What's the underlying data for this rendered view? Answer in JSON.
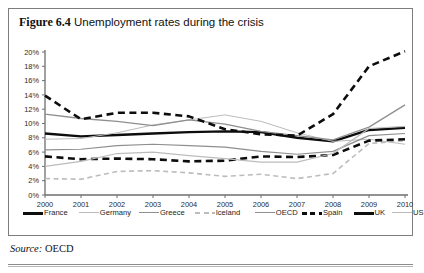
{
  "figure": {
    "label": "Figure 6.4",
    "title": "Unemployment rates during the crisis",
    "source_word": "Source:",
    "source_value": "OECD"
  },
  "colors": {
    "black": "#0d0d0d",
    "dark_gray": "#4a4a4a",
    "mid_gray": "#8f8f8f",
    "light_gray": "#bcbcbc",
    "axis": "#6e6e6e",
    "border": "#7d7d7d",
    "text": "#1d1d1d"
  },
  "chart_data": {
    "type": "line",
    "title": "Unemployment rates during the crisis",
    "xlabel": "",
    "ylabel": "",
    "xlim": [
      2000,
      2010
    ],
    "ylim": [
      0,
      20
    ],
    "ytick_step": 2,
    "grid": false,
    "legend_position": "bottom",
    "x": [
      2000,
      2001,
      2002,
      2003,
      2004,
      2005,
      2006,
      2007,
      2008,
      2009,
      2010
    ],
    "xtick_labels": [
      "2000",
      "2001",
      "2002",
      "2003",
      "2004",
      "2005",
      "2006",
      "2007",
      "2008",
      "2009",
      "2010"
    ],
    "ytick_labels": [
      "0%",
      "2%",
      "4%",
      "6%",
      "8%",
      "10%",
      "12%",
      "14%",
      "16%",
      "18%",
      "20%"
    ],
    "series": [
      {
        "name": "France",
        "style": "solid",
        "width": 2.4,
        "color": "#0d0d0d",
        "values": [
          8.6,
          8.2,
          8.4,
          8.6,
          8.8,
          8.9,
          8.8,
          8.0,
          7.5,
          9.1,
          9.4
        ]
      },
      {
        "name": "Germany",
        "style": "solid",
        "width": 1.0,
        "color": "#bcbcbc",
        "values": [
          7.8,
          7.9,
          8.7,
          9.8,
          10.5,
          11.2,
          10.3,
          8.7,
          7.5,
          7.8,
          7.1
        ]
      },
      {
        "name": "Greece",
        "style": "solid",
        "width": 1.3,
        "color": "#8f8f8f",
        "values": [
          11.3,
          10.7,
          10.3,
          9.7,
          10.5,
          9.9,
          8.9,
          8.3,
          7.7,
          9.5,
          12.6
        ]
      },
      {
        "name": "Iceland",
        "style": "dashed",
        "width": 1.6,
        "color": "#bcbcbc",
        "values": [
          2.3,
          2.2,
          3.3,
          3.4,
          3.1,
          2.6,
          2.9,
          2.3,
          3.0,
          7.2,
          7.6
        ]
      },
      {
        "name": "OECD",
        "style": "solid",
        "width": 1.2,
        "color": "#8f8f8f",
        "values": [
          6.3,
          6.4,
          6.9,
          7.1,
          6.9,
          6.7,
          6.1,
          5.7,
          6.1,
          8.3,
          8.6
        ]
      },
      {
        "name": "Spain",
        "style": "dashed",
        "width": 2.6,
        "color": "#0d0d0d",
        "values": [
          13.9,
          10.6,
          11.5,
          11.5,
          11.0,
          9.2,
          8.5,
          8.3,
          11.3,
          18.0,
          20.1
        ]
      },
      {
        "name": "UK",
        "style": "dashed",
        "width": 2.6,
        "color": "#0d0d0d",
        "values": [
          5.4,
          5.0,
          5.1,
          5.0,
          4.7,
          4.8,
          5.4,
          5.3,
          5.6,
          7.6,
          7.8
        ]
      },
      {
        "name": "US",
        "style": "solid",
        "width": 1.2,
        "color": "#bcbcbc",
        "values": [
          4.0,
          4.7,
          5.8,
          6.0,
          5.5,
          5.1,
          4.6,
          4.6,
          5.8,
          9.3,
          9.6
        ]
      }
    ]
  },
  "legend": {
    "items": [
      {
        "label": "France",
        "style": "solid",
        "width": 2.6,
        "color": "#0d0d0d"
      },
      {
        "label": "Germany",
        "style": "solid",
        "width": 1.0,
        "color": "#bcbcbc"
      },
      {
        "label": "Greece",
        "style": "solid",
        "width": 1.3,
        "color": "#8f8f8f"
      },
      {
        "label": "Iceland",
        "style": "dashed",
        "width": 1.6,
        "color": "#bcbcbc"
      },
      {
        "label": "OECD",
        "style": "solid",
        "width": 1.2,
        "color": "#8f8f8f"
      },
      {
        "label": "Spain",
        "style": "dashed",
        "width": 2.6,
        "color": "#0d0d0d"
      },
      {
        "label": "UK",
        "style": "solid",
        "width": 2.8,
        "color": "#0d0d0d"
      },
      {
        "label": "US",
        "style": "solid",
        "width": 1.2,
        "color": "#bcbcbc"
      }
    ]
  }
}
